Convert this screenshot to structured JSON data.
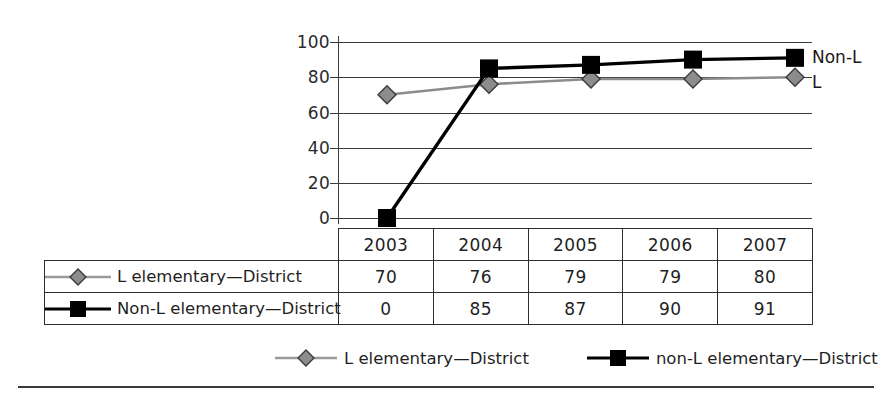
{
  "chart_data": {
    "type": "line",
    "title": "",
    "subtitle": "",
    "xlabel": "",
    "ylabel": "",
    "categories": [
      "2003",
      "2004",
      "2005",
      "2006",
      "2007"
    ],
    "ylim": [
      0,
      100
    ],
    "yticks": [
      0,
      20,
      40,
      60,
      80,
      100
    ],
    "grid": true,
    "legend_position": "bottom",
    "series": [
      {
        "name": "L elementary—District",
        "legend_name": "L elementary—District",
        "end_label": "L",
        "marker": "diamond",
        "color": "#8c8c8c",
        "values": [
          70,
          76,
          79,
          79,
          80
        ]
      },
      {
        "name": "Non-L elementary—District",
        "legend_name": "non-L elementary—District",
        "end_label": "Non-L",
        "marker": "square",
        "color": "#000000",
        "values": [
          0,
          85,
          87,
          90,
          91
        ]
      }
    ]
  },
  "axis": {
    "y_tick_labels": [
      "100",
      "80",
      "60",
      "40",
      "20",
      "0"
    ]
  },
  "table": {
    "corner_label": "",
    "column_headers": [
      "2003",
      "2004",
      "2005",
      "2006",
      "2007"
    ],
    "rows": [
      {
        "label": "L elementary—District",
        "marker": "diamond",
        "color": "#8c8c8c",
        "values": [
          "70",
          "76",
          "79",
          "79",
          "80"
        ]
      },
      {
        "label": "Non-L elementary—District",
        "marker": "square",
        "color": "#000000",
        "values": [
          "0",
          "85",
          "87",
          "90",
          "91"
        ]
      }
    ]
  },
  "legend": {
    "entries": [
      {
        "label": "L elementary—District",
        "marker": "diamond",
        "color": "#8c8c8c"
      },
      {
        "label": "non-L elementary—District",
        "marker": "square",
        "color": "#000000"
      }
    ]
  },
  "colors": {
    "series_l": "#8c8c8c",
    "series_nonl": "#000000",
    "axis": "#3a3a3a",
    "text": "#1f1f1f",
    "background": "#ffffff"
  }
}
